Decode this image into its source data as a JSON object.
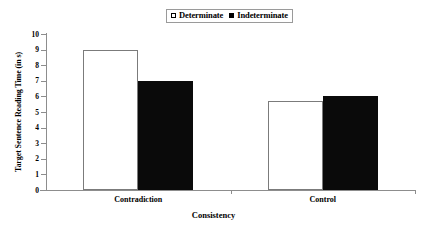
{
  "chart_data": {
    "type": "bar",
    "title": "",
    "xlabel": "Consistency",
    "ylabel": "Target Sentence Reading Time (in s)",
    "categories": [
      "Contradiction",
      "Control"
    ],
    "series": [
      {
        "name": "Determinate",
        "values": [
          9.0,
          5.7
        ],
        "style": "open",
        "color": "#ffffff"
      },
      {
        "name": "Indeterminate",
        "values": [
          7.0,
          6.0
        ],
        "style": "filled",
        "color": "#000000"
      }
    ],
    "ylim": [
      0,
      10
    ],
    "ytick_labels": [
      "10",
      "9",
      "8",
      "7",
      "6",
      "5",
      "4",
      "3",
      "2",
      "1",
      "0"
    ],
    "ytick_values": [
      10,
      9,
      8,
      7,
      6,
      5,
      4,
      3,
      2,
      1,
      0
    ],
    "grid": false,
    "legend_position": "top-center"
  },
  "legend": {
    "entries": [
      {
        "label": "Determinate",
        "swatch": "open-square-icon"
      },
      {
        "label": "Indeterminate",
        "swatch": "filled-square-icon"
      }
    ]
  }
}
